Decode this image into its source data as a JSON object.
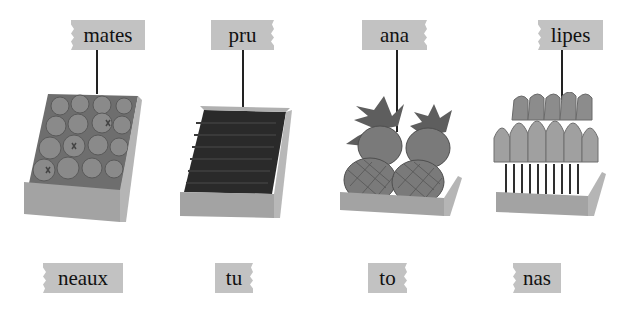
{
  "top_labels": [
    {
      "text": "mates",
      "item": "tomatoes"
    },
    {
      "text": "pru",
      "item": "prunes"
    },
    {
      "text": "ana",
      "item": "pineapples"
    },
    {
      "text": "lipes",
      "item": "tulips"
    }
  ],
  "bottom_labels": [
    {
      "text": "neaux"
    },
    {
      "text": "tu"
    },
    {
      "text": "to"
    },
    {
      "text": "nas"
    }
  ],
  "colors": {
    "tag_background": "#c2c2c2",
    "text": "#111111",
    "stem": "#222222",
    "crate_front": "#9e9e9e",
    "crate_side": "#b8b8b8"
  }
}
